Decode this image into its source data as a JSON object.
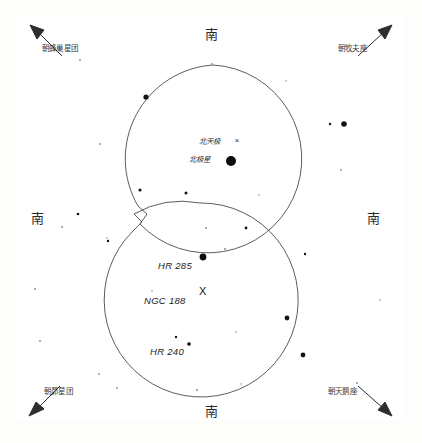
{
  "figure": {
    "type": "sky-chart"
  },
  "cardinals": {
    "top": "南",
    "bottom": "南",
    "left": "南",
    "right": "南"
  },
  "corner_labels": [
    {
      "id": "top-left",
      "text": "朝蜂巢星团",
      "arrow": "up-left"
    },
    {
      "id": "top-right",
      "text": "朝牧夫座",
      "arrow": "up-right"
    },
    {
      "id": "bottom-left",
      "text": "朝昴星团",
      "arrow": "down-left"
    },
    {
      "id": "bottom-right",
      "text": "朝天鹅座",
      "arrow": "down-right"
    }
  ],
  "pole_labels": {
    "celestial_pole": "北天极",
    "celestial_pole_marker": "×",
    "polaris": "北极星",
    "polaris_marker": "●"
  },
  "objects": [
    {
      "name": "HR 285",
      "marker": "dot"
    },
    {
      "name": "NGC 188",
      "marker": "X"
    },
    {
      "name": "HR 240",
      "marker": "dot"
    }
  ],
  "chart_data": {
    "type": "scatter",
    "title": "",
    "xlabel": "",
    "ylabel": "",
    "grid": false,
    "legend": "none",
    "xlim": [
      0,
      422
    ],
    "ylim": [
      0,
      443
    ],
    "note": "Two overlapping circular telescope fields of view drawn over a star field near the north celestial pole. Coordinates are in screenshot pixel space.",
    "fields_of_view": [
      {
        "id": "upper-circle",
        "cx": 213,
        "cy": 159,
        "r": 94
      },
      {
        "id": "lower-circle",
        "cx": 200,
        "cy": 300,
        "r": 97
      }
    ],
    "labeled_points": [
      {
        "label": "北极星",
        "x": 231,
        "y": 161,
        "size": 5.0,
        "marker": "dot"
      },
      {
        "label": "北天极",
        "x": 238,
        "y": 143,
        "size": 3.2,
        "marker": "x"
      },
      {
        "label": "HR 285",
        "x": 203,
        "y": 257,
        "size": 3.4,
        "marker": "dot"
      },
      {
        "label": "NGC 188",
        "x": 204,
        "y": 292,
        "size": 4.0,
        "marker": "x"
      },
      {
        "label": "HR 240",
        "x": 189,
        "y": 344,
        "size": 1.8,
        "marker": "dot"
      }
    ],
    "stars": [
      {
        "x": 146,
        "y": 97,
        "size": 2.6
      },
      {
        "x": 140,
        "y": 190,
        "size": 1.6
      },
      {
        "x": 344,
        "y": 124,
        "size": 2.8
      },
      {
        "x": 330,
        "y": 124,
        "size": 1.2
      },
      {
        "x": 341,
        "y": 170,
        "size": 0.9
      },
      {
        "x": 78,
        "y": 214,
        "size": 1.3
      },
      {
        "x": 62,
        "y": 227,
        "size": 1.0
      },
      {
        "x": 108,
        "y": 241,
        "size": 1.2
      },
      {
        "x": 107,
        "y": 238,
        "size": 0.8
      },
      {
        "x": 186,
        "y": 193,
        "size": 1.5
      },
      {
        "x": 206,
        "y": 228,
        "size": 1.0
      },
      {
        "x": 246,
        "y": 228,
        "size": 1.4
      },
      {
        "x": 305,
        "y": 254,
        "size": 1.2
      },
      {
        "x": 287,
        "y": 318,
        "size": 2.4
      },
      {
        "x": 303,
        "y": 355,
        "size": 2.4
      },
      {
        "x": 225,
        "y": 249,
        "size": 1.0
      },
      {
        "x": 176,
        "y": 337,
        "size": 1.2
      },
      {
        "x": 35,
        "y": 289,
        "size": 1.0
      },
      {
        "x": 40,
        "y": 341,
        "size": 0.9
      },
      {
        "x": 99,
        "y": 374,
        "size": 0.9
      },
      {
        "x": 117,
        "y": 388,
        "size": 0.9
      },
      {
        "x": 197,
        "y": 390,
        "size": 1.0
      },
      {
        "x": 241,
        "y": 384,
        "size": 0.8
      },
      {
        "x": 357,
        "y": 383,
        "size": 1.0
      },
      {
        "x": 380,
        "y": 300,
        "size": 0.8
      },
      {
        "x": 80,
        "y": 60,
        "size": 0.9
      },
      {
        "x": 212,
        "y": 64,
        "size": 0.9
      },
      {
        "x": 100,
        "y": 144,
        "size": 0.9
      },
      {
        "x": 286,
        "y": 81,
        "size": 0.8
      },
      {
        "x": 259,
        "y": 195,
        "size": 0.8
      },
      {
        "x": 152,
        "y": 291,
        "size": 0.8
      },
      {
        "x": 236,
        "y": 332,
        "size": 0.8
      }
    ]
  }
}
